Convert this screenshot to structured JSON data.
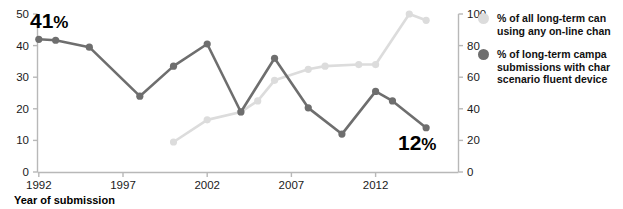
{
  "chart_data": {
    "type": "line",
    "title": "",
    "xlabel": "Year of submission",
    "ylabel": "",
    "xlim": [
      1991,
      2016
    ],
    "xticks": [
      1992,
      1997,
      2002,
      2007,
      2012
    ],
    "xticklabels": [
      "1992",
      "1997",
      "2002",
      "2007",
      "2012"
    ],
    "grid": false,
    "legend_position": "right",
    "axes": [
      {
        "id": "left",
        "side": "left",
        "ylim": [
          0,
          50
        ],
        "yticks": [
          0,
          10,
          20,
          30,
          40,
          50
        ],
        "yticklabels": [
          "0",
          "10",
          "20",
          "30",
          "40",
          "50"
        ]
      },
      {
        "id": "right",
        "side": "right",
        "ylim": [
          0,
          100
        ],
        "yticks": [
          0,
          20,
          40,
          60,
          80,
          100
        ],
        "yticklabels": [
          "0",
          "20",
          "40",
          "60",
          "80",
          "100"
        ]
      }
    ],
    "series": [
      {
        "name": "% of all long-term can using any on-line chan",
        "axis": "right",
        "color": "#dcdcdc",
        "marker": "circle",
        "x": [
          2000,
          2002,
          2004,
          2005,
          2006,
          2008,
          2009,
          2011,
          2012,
          2014,
          2015
        ],
        "values": [
          19,
          33,
          38,
          45,
          58,
          65,
          67,
          68,
          68,
          100,
          96
        ]
      },
      {
        "name": "% of long-term campa submissions with char scenario fluent device",
        "axis": "left",
        "color": "#6e6e6e",
        "marker": "circle",
        "x": [
          1992,
          1993,
          1995,
          1998,
          2000,
          2002,
          2004,
          2006,
          2008,
          2010,
          2012,
          2013,
          2015
        ],
        "values": [
          42,
          41.7,
          39.5,
          24,
          33.5,
          40.5,
          19,
          36,
          20.3,
          12,
          25.5,
          22.5,
          14
        ]
      }
    ],
    "annotations": [
      {
        "text": "41",
        "suffix": "%",
        "x_px": 30,
        "y_px": 28
      },
      {
        "text": "12",
        "suffix": "%",
        "x_px": 398,
        "y_px": 150
      }
    ]
  },
  "legend": {
    "items": [
      {
        "marker_color": "#dcdcdc",
        "lines": [
          "% of all long-term can",
          "using any on-line chan"
        ]
      },
      {
        "marker_color": "#6e6e6e",
        "lines": [
          "% of long-term campa",
          "submissions with char",
          "scenario fluent device"
        ]
      }
    ]
  }
}
